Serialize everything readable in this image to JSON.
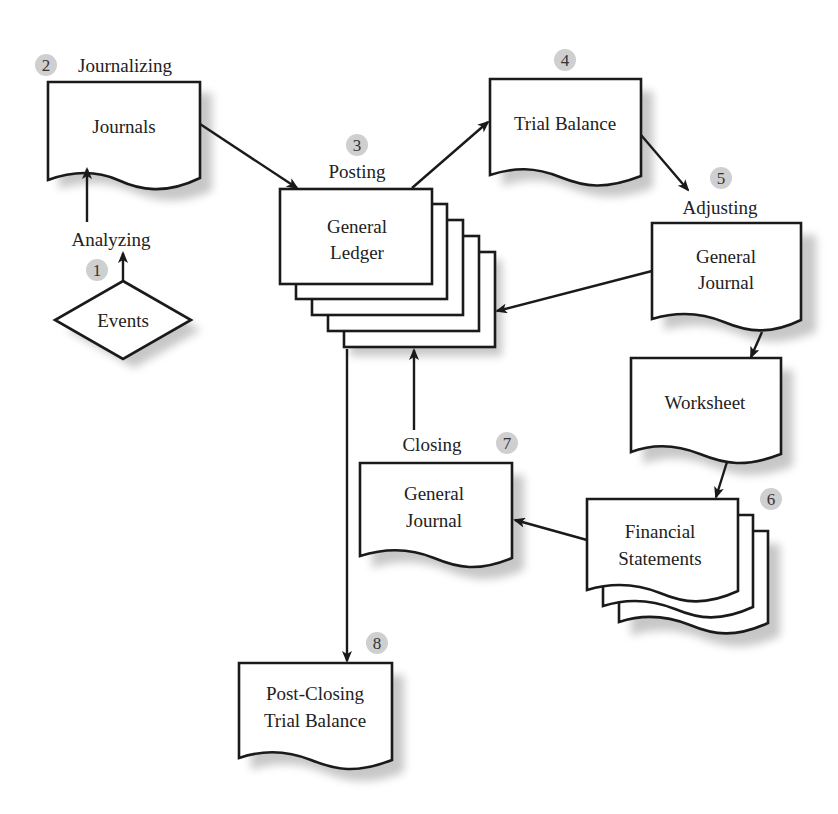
{
  "diagram": {
    "nodes": {
      "events": {
        "label": "Events",
        "shape": "decision"
      },
      "journals": {
        "label": "Journals",
        "shape": "document"
      },
      "general_ledger": {
        "lines": [
          "General",
          "Ledger"
        ],
        "shape": "stacked-rectangles"
      },
      "trial_balance": {
        "label": "Trial Balance",
        "shape": "document"
      },
      "adjusting_journal": {
        "lines": [
          "General",
          "Journal"
        ],
        "shape": "document"
      },
      "worksheet": {
        "label": "Worksheet",
        "shape": "document"
      },
      "financial_statements": {
        "lines": [
          "Financial",
          "Statements"
        ],
        "shape": "stacked-documents"
      },
      "closing_journal": {
        "lines": [
          "General",
          "Journal"
        ],
        "shape": "document"
      },
      "post_closing": {
        "lines": [
          "Post-Closing",
          "Trial Balance"
        ],
        "shape": "document"
      }
    },
    "steps": [
      {
        "number": "1",
        "label": "Analyzing"
      },
      {
        "number": "2",
        "label": "Journalizing"
      },
      {
        "number": "3",
        "label": "Posting"
      },
      {
        "number": "4",
        "label": ""
      },
      {
        "number": "5",
        "label": "Adjusting"
      },
      {
        "number": "6",
        "label": ""
      },
      {
        "number": "7",
        "label": "Closing"
      },
      {
        "number": "8",
        "label": ""
      }
    ],
    "edges": [
      {
        "from": "events",
        "to": "journals"
      },
      {
        "from": "journals",
        "to": "general_ledger"
      },
      {
        "from": "general_ledger",
        "to": "trial_balance"
      },
      {
        "from": "trial_balance",
        "to": "adjusting_journal"
      },
      {
        "from": "adjusting_journal",
        "to": "general_ledger"
      },
      {
        "from": "adjusting_journal",
        "to": "worksheet"
      },
      {
        "from": "worksheet",
        "to": "financial_statements"
      },
      {
        "from": "financial_statements",
        "to": "closing_journal"
      },
      {
        "from": "closing_journal",
        "to": "general_ledger"
      },
      {
        "from": "general_ledger",
        "to": "post_closing"
      }
    ]
  }
}
